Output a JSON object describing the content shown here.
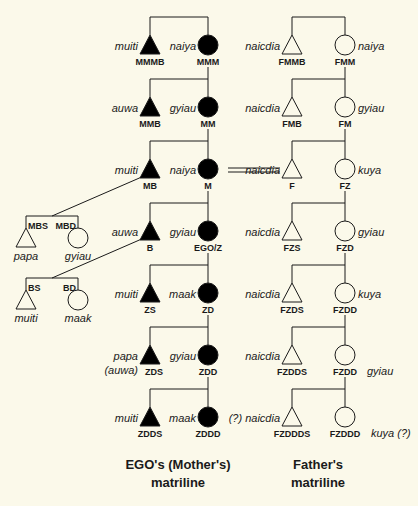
{
  "colors": {
    "background": "#fbf9ea",
    "ink": "#1a1a1a",
    "filled": "#000000",
    "empty": "#fbf9ea"
  },
  "legend_symbols": {
    "male": "triangle",
    "female": "circle",
    "filled_meaning": "EGO's matriline",
    "empty_meaning": "Father's matriline"
  },
  "mother_line": {
    "caption_line1": "EGO's (Mother's)",
    "caption_line2": "matriline",
    "generations": [
      {
        "male": {
          "code": "MMMB",
          "term": "muiti"
        },
        "female": {
          "code": "MMM",
          "term": "naiya"
        }
      },
      {
        "male": {
          "code": "MMB",
          "term": "auwa"
        },
        "female": {
          "code": "MM",
          "term": "gyiau"
        }
      },
      {
        "male": {
          "code": "MB",
          "term": "muiti"
        },
        "female": {
          "code": "M",
          "term": "naiya"
        }
      },
      {
        "male": {
          "code": "B",
          "term": "auwa"
        },
        "female": {
          "code": "EGO/Z",
          "term": "gyiau"
        }
      },
      {
        "male": {
          "code": "ZS",
          "term": "muiti"
        },
        "female": {
          "code": "ZD",
          "term": "maak"
        }
      },
      {
        "male": {
          "code": "ZDS",
          "term": "papa",
          "term_alt": "(auwa)"
        },
        "female": {
          "code": "ZDD",
          "term": "gyiau"
        }
      },
      {
        "male": {
          "code": "ZDDS",
          "term": "muiti"
        },
        "female": {
          "code": "ZDDD",
          "term": "maak"
        }
      }
    ]
  },
  "father_line": {
    "caption_line1": "Father's",
    "caption_line2": "matriline",
    "generations": [
      {
        "male": {
          "code": "FMMB",
          "term": "naicdia"
        },
        "female": {
          "code": "FMM",
          "term": "naiya"
        }
      },
      {
        "male": {
          "code": "FMB",
          "term": "naicdia"
        },
        "female": {
          "code": "FM",
          "term": "gyiau"
        }
      },
      {
        "male": {
          "code": "F",
          "term": "naicdia"
        },
        "female": {
          "code": "FZ",
          "term": "kuya"
        }
      },
      {
        "male": {
          "code": "FZS",
          "term": "naicdia"
        },
        "female": {
          "code": "FZD",
          "term": "gyiau"
        }
      },
      {
        "male": {
          "code": "FZDS",
          "term": "naicdia"
        },
        "female": {
          "code": "FZDD",
          "term": "kuya"
        }
      },
      {
        "male": {
          "code": "FZDDS",
          "term": "naicdia"
        },
        "female": {
          "code": "FZDD",
          "term": "gyiau"
        }
      },
      {
        "male": {
          "code": "FZDDDS",
          "term": "(?) naicdia"
        },
        "female": {
          "code": "FZDDD",
          "term": "kuya (?)"
        }
      }
    ]
  },
  "side_branches": {
    "mb_children": {
      "son": {
        "code": "MBS",
        "term": "papa"
      },
      "daughter": {
        "code": "MBD",
        "term": "gyiau"
      }
    },
    "b_children": {
      "son": {
        "code": "BS",
        "term": "muiti"
      },
      "daughter": {
        "code": "BD",
        "term": "maak"
      }
    }
  },
  "marriage_link": {
    "from": "M",
    "to": "F",
    "style": "double-line"
  }
}
